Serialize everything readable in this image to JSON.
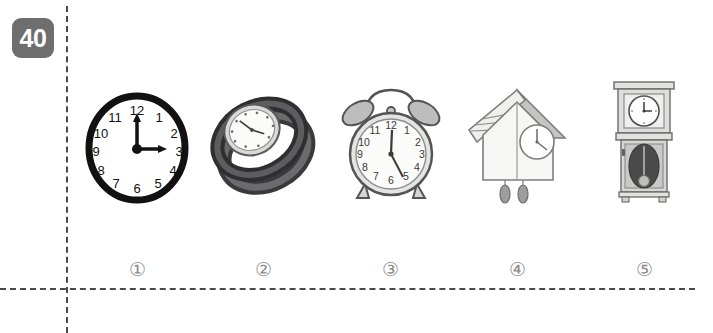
{
  "question": {
    "number": "40",
    "badge_color": "#6e6e6e",
    "badge_text_color": "#ffffff"
  },
  "rules": {
    "line_color": "#4a4a4a",
    "vertical_x": 66,
    "horizontal_y": 288
  },
  "options": [
    {
      "marker": "①",
      "number": "1",
      "name": "wall-clock",
      "label": "wall clock",
      "time": "3:00",
      "numerals": [
        "12",
        "1",
        "2",
        "3",
        "4",
        "5",
        "6",
        "7",
        "8",
        "9",
        "10",
        "11"
      ],
      "has_numerals": true,
      "hour_angle": 90,
      "minute_angle": 0,
      "outline_color": "#111111",
      "face_color": "#ffffff"
    },
    {
      "marker": "②",
      "number": "2",
      "name": "wristwatch",
      "label": "wristwatch",
      "time": "1:50",
      "has_numerals": false,
      "hour_angle": 55,
      "minute_angle": 300,
      "strap_color": "#58585a",
      "strap_shadow_color": "#3a3a3c",
      "face_color": "#f2f2f0"
    },
    {
      "marker": "③",
      "number": "3",
      "name": "alarm-clock",
      "label": "alarm clock",
      "time": "12:25",
      "numerals": [
        "12",
        "1",
        "2",
        "3",
        "4",
        "5",
        "6",
        "7",
        "8",
        "9",
        "10",
        "11"
      ],
      "has_numerals": true,
      "hour_angle": 6,
      "minute_angle": 152,
      "bell_color": "#b8b8b8",
      "body_color": "#f4f4f2",
      "outline_color": "#4d4d4d"
    },
    {
      "marker": "④",
      "number": "4",
      "name": "cuckoo-clock",
      "label": "cuckoo clock",
      "time": "11:35",
      "has_numerals": false,
      "hour_angle": 342,
      "minute_angle": 210,
      "roof_color": "#e9e9e7",
      "body_color": "#f3f3f1",
      "outline_color": "#8a8a8a",
      "weight_color": "#9a9a9a"
    },
    {
      "marker": "⑤",
      "number": "5",
      "name": "grandfather-clock",
      "label": "grandfather clock",
      "time": "3:00",
      "has_numerals": false,
      "hour_angle": 90,
      "minute_angle": 0,
      "case_color": "#d8d8d6",
      "panel_color": "#c8c8c6",
      "pendulum_color": "#4a4a4a",
      "outline_color": "#6b6b6b"
    }
  ]
}
